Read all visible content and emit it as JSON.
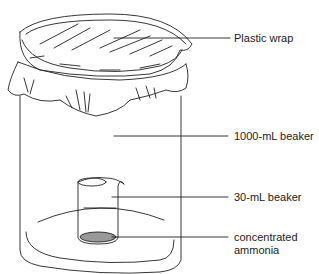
{
  "diagram": {
    "labels": {
      "plastic_wrap": "Plastic wrap",
      "large_beaker": "1000-mL beaker",
      "small_beaker": "30-mL beaker",
      "ammonia_line1": "concentrated",
      "ammonia_line2": "ammonia"
    },
    "colors": {
      "stroke": "#222222",
      "text": "#222222",
      "liquid": "#888888"
    }
  }
}
